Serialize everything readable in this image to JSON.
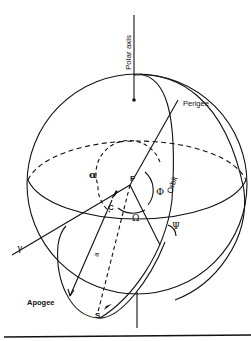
{
  "diagram": {
    "type": "celestial-sphere orbit geometry",
    "labels": {
      "polar_axis": "Polar axis",
      "perigee": "Perigee",
      "apogee": "Apogee",
      "orbit": "Orbit",
      "focus": "F",
      "center": "C",
      "satellite": "S",
      "semi_major_axis": "a",
      "alpha": "α",
      "phi": "Φ",
      "omega": "Ω",
      "psi": "Ψ",
      "vernal_equinox": "γ"
    },
    "colors": {
      "ink": "#111111",
      "background": "#ffffff"
    }
  }
}
